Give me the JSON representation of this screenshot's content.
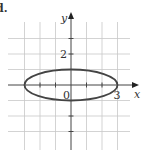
{
  "part_label": "d.",
  "chart_data": {
    "type": "line",
    "title": "",
    "xlabel": "x",
    "ylabel": "y",
    "xlim": [
      -4.5,
      4.5
    ],
    "ylim": [
      -4.5,
      4.5
    ],
    "grid": true,
    "grid_step": 1,
    "tick_labels": {
      "x": [
        {
          "value": 3,
          "label": "3"
        }
      ],
      "y": [
        {
          "value": 2,
          "label": "2"
        }
      ],
      "origin": "0"
    },
    "series": [
      {
        "name": "ellipse",
        "equation": "x^2/9 + y^2 = 1",
        "center": [
          0,
          0
        ],
        "semi_axis_x": 3,
        "semi_axis_y": 1,
        "color": "#444444"
      }
    ]
  }
}
